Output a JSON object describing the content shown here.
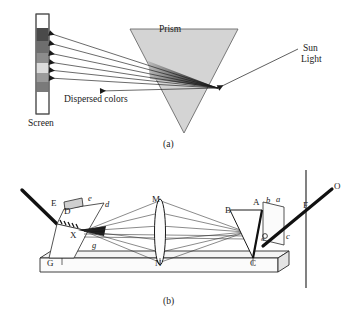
{
  "figure": {
    "panels": [
      {
        "id": "a",
        "caption": "(a)",
        "caption_x": 163,
        "caption_y": 140,
        "labels": [
          {
            "name": "prism-label",
            "text": "Prism",
            "x": 159,
            "y": 25,
            "class": "lbl-md"
          },
          {
            "name": "sun-light-label-line1",
            "text": "Sun",
            "x": 303,
            "y": 44,
            "class": "lbl-md"
          },
          {
            "name": "sun-light-label-line2",
            "text": "Light",
            "x": 301,
            "y": 55,
            "class": "lbl-md"
          },
          {
            "name": "dispersed-colors-label",
            "text": "Dispersed colors",
            "x": 64,
            "y": 95,
            "class": "lbl-md"
          },
          {
            "name": "screen-label",
            "text": "Screen",
            "x": 28,
            "y": 119,
            "class": "lbl-md"
          }
        ],
        "screen": {
          "x": 36,
          "y": 14,
          "width": 13,
          "height": 100,
          "bands": [
            {
              "name": "band-violet",
              "color": "#4a4a4a",
              "y": 28,
              "height": 13
            },
            {
              "name": "band-blue",
              "color": "#6e6e6e",
              "y": 41,
              "height": 12
            },
            {
              "name": "band-green",
              "color": "#8c8c8c",
              "y": 53,
              "height": 10
            },
            {
              "name": "band-yellow",
              "color": "#dcdcdc",
              "y": 63,
              "height": 10
            },
            {
              "name": "band-orange",
              "color": "#9a9a9a",
              "y": 73,
              "height": 9
            },
            {
              "name": "band-red",
              "color": "#7a7a7a",
              "y": 82,
              "height": 10
            }
          ]
        },
        "prism": {
          "name": "prism-triangle",
          "points": "130,29 238,29 184,133",
          "fill": "#d4d4d4",
          "stroke": "#6b6b6b"
        },
        "incident_ray": {
          "name": "incident-ray",
          "x1": 298,
          "y1": 49,
          "x2": 218,
          "y2": 88
        },
        "exit_point": {
          "x": 218,
          "y": 88
        },
        "dispersed_rays": [
          {
            "name": "dispersed-ray-1",
            "y_end": 33
          },
          {
            "name": "dispersed-ray-2",
            "y_end": 43
          },
          {
            "name": "dispersed-ray-3",
            "y_end": 53
          },
          {
            "name": "dispersed-ray-4",
            "y_end": 62
          },
          {
            "name": "dispersed-ray-5",
            "y_end": 70
          },
          {
            "name": "dispersed-ray-6",
            "y_end": 78
          },
          {
            "name": "dispersed-ray-7",
            "y_end": 89
          }
        ]
      },
      {
        "id": "b",
        "caption": "(b)",
        "caption_x": 163,
        "caption_y": 297,
        "labels": [
          {
            "name": "point-label-E",
            "text": "E",
            "x": 51,
            "y": 199,
            "class": "lbl-pt"
          },
          {
            "name": "point-label-D",
            "text": "D",
            "x": 64,
            "y": 207,
            "class": "lbl-pt"
          },
          {
            "name": "point-label-X",
            "text": "X",
            "x": 70,
            "y": 231,
            "class": "lbl-pt"
          },
          {
            "name": "point-label-G",
            "text": "G",
            "x": 47,
            "y": 267,
            "class": "lbl-pt"
          },
          {
            "name": "point-label-M",
            "text": "M",
            "x": 152,
            "y": 195,
            "class": "lbl-pt"
          },
          {
            "name": "point-label-N",
            "text": "N",
            "x": 155,
            "y": 267,
            "class": "lbl-pt"
          },
          {
            "name": "point-label-B",
            "text": "B",
            "x": 225,
            "y": 206,
            "class": "lbl-pt"
          },
          {
            "name": "point-label-A",
            "text": "A",
            "x": 253,
            "y": 198,
            "class": "lbl-pt"
          },
          {
            "name": "point-label-C",
            "text": "C",
            "x": 250,
            "y": 267,
            "class": "lbl-pt"
          },
          {
            "name": "point-label-F",
            "text": "F",
            "x": 305,
            "y": 201,
            "class": "lbl-pt"
          },
          {
            "name": "point-label-O",
            "text": "O",
            "x": 334,
            "y": 184,
            "class": "lbl-pt"
          },
          {
            "name": "italic-label-e",
            "text": "e",
            "x": 88,
            "y": 196,
            "class": "lbl-it"
          },
          {
            "name": "italic-label-d",
            "text": "d",
            "x": 105,
            "y": 202,
            "class": "lbl-it"
          },
          {
            "name": "italic-label-g",
            "text": "g",
            "x": 92,
            "y": 243,
            "class": "lbl-it"
          },
          {
            "name": "italic-label-b",
            "text": "b",
            "x": 268,
            "y": 198,
            "class": "lbl-it"
          },
          {
            "name": "italic-label-a",
            "text": "a",
            "x": 277,
            "y": 197,
            "class": "lbl-it"
          },
          {
            "name": "italic-label-c",
            "text": "c",
            "x": 285,
            "y": 234,
            "class": "lbl-it"
          },
          {
            "name": "italic-label-o",
            "text": "o",
            "x": 262,
            "y": 238,
            "class": "lbl-tiny"
          }
        ],
        "bench": {
          "name": "optical-bench",
          "top_face": "40,258 278,258 289,251 51,251",
          "front_face": "40,258 278,258 278,272 40,272",
          "side_face": "278,258 289,251 289,265 278,272",
          "fill": "#f2f2f2",
          "stroke": "#3a3a3a"
        },
        "vertical_line": {
          "name": "eye-plane-line",
          "x": 306,
          "y1": 170,
          "y2": 288
        },
        "input_beam": {
          "name": "input-light-beam",
          "x1": 22,
          "y1": 190,
          "x2": 56,
          "y2": 224
        },
        "output_beam": {
          "name": "output-light-beam",
          "x1": 264,
          "y1": 245,
          "x2": 330,
          "y2": 190
        },
        "collimator": {
          "name": "collimator-tube",
          "body": "56,224 62,210 104,204 86,232",
          "slit_box": "62,203 82,199 82,207 62,211"
        },
        "lens": {
          "name": "lens-MN",
          "cx": 160,
          "cy": 232,
          "rx": 5.5,
          "ry": 33
        },
        "prism_b": {
          "name": "prism-b",
          "points": "230,210 262,210 253,258"
        },
        "screen_card": {
          "name": "screen-card",
          "points": "262,203 283,208 283,245 262,240"
        }
      }
    ]
  }
}
